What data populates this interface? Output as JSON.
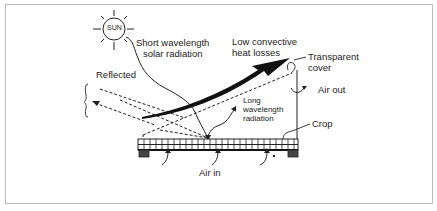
{
  "diagram": {
    "sun_label": "SUN",
    "labels": {
      "short_wave_1": "Short wavelength",
      "short_wave_2": "solar radiation",
      "convective_1": "Low convective",
      "convective_2": "heat losses",
      "cover_1": "Transparent",
      "cover_2": "cover",
      "reflected": "Reflected",
      "air_out": "Air out",
      "long_wave_1": "Long",
      "long_wave_2": "wavelength",
      "long_wave_3": "radiation",
      "crop": "Crop",
      "air_in": "Air in"
    },
    "colors": {
      "line": "#1a1a1a",
      "frame": "#bdbdbd",
      "background": "#ffffff"
    }
  }
}
